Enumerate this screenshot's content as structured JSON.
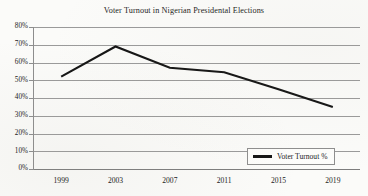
{
  "chart_data": {
    "type": "line",
    "title": "Voter Turnout in Nigerian Presidental Elections",
    "xlabel": "",
    "ylabel": "",
    "x": [
      "1999",
      "2003",
      "2007",
      "2011",
      "2015",
      "2019"
    ],
    "categories": [
      "1999",
      "2003",
      "2007",
      "2011",
      "2015",
      "2019"
    ],
    "series": [
      {
        "name": "Voter Turnout %",
        "color": "#141414",
        "values": [
          52,
          69,
          57,
          54.5,
          45,
          35
        ]
      }
    ],
    "ylim": [
      0,
      80
    ],
    "y_ticks": [
      0,
      10,
      20,
      30,
      40,
      50,
      60,
      70,
      80
    ],
    "y_tick_labels": [
      "0%",
      "10%",
      "20%",
      "30%",
      "40%",
      "50%",
      "60%",
      "70%",
      "80%"
    ],
    "x_tick_labels": [
      "1999",
      "2003",
      "2007",
      "2011",
      "2015",
      "2019"
    ],
    "grid": true,
    "grid_axis": "y",
    "legend": {
      "position": "bottom-right",
      "entries": [
        {
          "label": "Voter Turnout %",
          "marker": "line",
          "color": "#141414"
        }
      ]
    }
  },
  "colors": {
    "background": "#fbfbf9",
    "gridline": "#9a9a9a",
    "axis": "#8d8d8d",
    "series": "#141414",
    "text": "#1b1b1b",
    "legend_border": "#8e8e8e"
  }
}
